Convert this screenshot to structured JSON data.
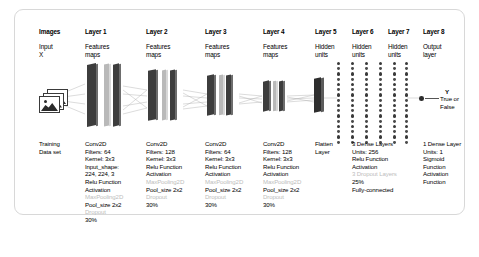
{
  "figure": {
    "columns": [
      {
        "id": "input",
        "head": "Images",
        "sub": "Input\nX",
        "desc": [
          {
            "t": "Training",
            "faint": false
          },
          {
            "t": "Data set",
            "faint": false
          }
        ]
      },
      {
        "id": "layer1",
        "head": "Layer 1",
        "sub": "Features\nmaps",
        "desc": [
          {
            "t": "Conv2D",
            "faint": false
          },
          {
            "t": "Filters: 64",
            "faint": false
          },
          {
            "t": "Kernel: 3x3",
            "faint": false
          },
          {
            "t": "Input_shape:",
            "faint": false
          },
          {
            "t": "224, 224, 3",
            "faint": false
          },
          {
            "t": "Relu Function",
            "faint": false
          },
          {
            "t": "Activation",
            "faint": false
          },
          {
            "t": "MaxPooling2D",
            "faint": true
          },
          {
            "t": "Pool_size 2x2",
            "faint": false
          },
          {
            "t": "Dropout",
            "faint": true
          },
          {
            "t": "30%",
            "faint": false
          }
        ]
      },
      {
        "id": "layer2",
        "head": "Layer 2",
        "sub": "Features\nmaps",
        "desc": [
          {
            "t": "Conv2D",
            "faint": false
          },
          {
            "t": "Filters: 128",
            "faint": false
          },
          {
            "t": "Kernel: 3x3",
            "faint": false
          },
          {
            "t": "Relu Function",
            "faint": false
          },
          {
            "t": "Activation",
            "faint": false
          },
          {
            "t": "MaxPooling2D",
            "faint": true
          },
          {
            "t": "Pool_size 2x2",
            "faint": false
          },
          {
            "t": "Dropout",
            "faint": true
          },
          {
            "t": "30%",
            "faint": false
          }
        ]
      },
      {
        "id": "layer3",
        "head": "Layer 3",
        "sub": "Features\nmaps",
        "desc": [
          {
            "t": "Conv2D",
            "faint": false
          },
          {
            "t": "Filters: 64",
            "faint": false
          },
          {
            "t": "Kernel: 3x3",
            "faint": false
          },
          {
            "t": "Relu Function",
            "faint": false
          },
          {
            "t": "Activation",
            "faint": false
          },
          {
            "t": "MaxPooling2D",
            "faint": true
          },
          {
            "t": "Pool_size 2x2",
            "faint": false
          },
          {
            "t": "Dropout",
            "faint": true
          },
          {
            "t": "30%",
            "faint": false
          }
        ]
      },
      {
        "id": "layer4",
        "head": "Layer 4",
        "sub": "Features\nmaps",
        "desc": [
          {
            "t": "Conv2D",
            "faint": false
          },
          {
            "t": "Filters: 128",
            "faint": false
          },
          {
            "t": "Kernel: 3x3",
            "faint": false
          },
          {
            "t": "Relu Function",
            "faint": false
          },
          {
            "t": "Activation",
            "faint": false
          },
          {
            "t": "MaxPooling2D",
            "faint": true
          },
          {
            "t": "Pool_size 2x2",
            "faint": false
          },
          {
            "t": "Dropout",
            "faint": true
          },
          {
            "t": "30%",
            "faint": false
          }
        ]
      },
      {
        "id": "flatten",
        "head": "Layer 5",
        "sub": "Hidden\nunits",
        "desc": [
          {
            "t": "Flatten",
            "faint": false
          },
          {
            "t": "Layer",
            "faint": false
          }
        ]
      },
      {
        "id": "layer6",
        "head": "Layer 6",
        "sub": "Hidden\nunits",
        "desc": [
          {
            "t": "3 Dense Layers",
            "faint": false
          },
          {
            "t": "Units: 256",
            "faint": false
          },
          {
            "t": "Relu Function",
            "faint": false
          },
          {
            "t": "Activation",
            "faint": false
          },
          {
            "t": "3 Dropout Layers",
            "faint": true
          },
          {
            "t": "25%",
            "faint": false
          },
          {
            "t": "Fully-connected",
            "faint": false
          }
        ]
      },
      {
        "id": "layer7",
        "head": "Layer 7",
        "sub": "Hidden\nunits",
        "desc": []
      },
      {
        "id": "layer8",
        "head": "Layer 8",
        "sub": "Output\nlayer",
        "desc": [
          {
            "t": "1 Dense Layer",
            "faint": false
          },
          {
            "t": "Units: 1",
            "faint": false
          },
          {
            "t": "Sigmoid",
            "faint": false
          },
          {
            "t": "Function",
            "faint": false
          },
          {
            "t": "Activation",
            "faint": false
          },
          {
            "t": "Function",
            "faint": false
          }
        ]
      }
    ],
    "output": {
      "y_symbol": "Y",
      "y_values": "True or\nFalse"
    },
    "icons": {
      "input_images": "stacked-photos-icon"
    },
    "colors": {
      "slab_dark": "#3d3d3d",
      "slab_light": "#b9b9b9",
      "dot": "#4a4a4a",
      "border": "#d8d8d8",
      "faint_text": "#bdbdbd"
    }
  }
}
